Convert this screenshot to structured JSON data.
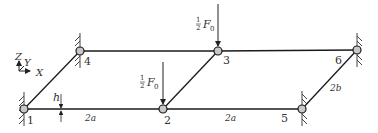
{
  "diagram": {
    "type": "truss-structure",
    "axes": {
      "z": "Z",
      "y": "Y",
      "x": "X"
    },
    "nodes": [
      {
        "id": "1",
        "x": 24,
        "y": 109,
        "support": "wall-left"
      },
      {
        "id": "2",
        "x": 163,
        "y": 109,
        "support": "none"
      },
      {
        "id": "3",
        "x": 218,
        "y": 51,
        "support": "none"
      },
      {
        "id": "4",
        "x": 80,
        "y": 51,
        "support": "wall-left"
      },
      {
        "id": "5",
        "x": 302,
        "y": 109,
        "support": "wall-right"
      },
      {
        "id": "6",
        "x": 357,
        "y": 50,
        "support": "wall-right"
      }
    ],
    "members": [
      [
        "1",
        "2"
      ],
      [
        "2",
        "5"
      ],
      [
        "4",
        "3"
      ],
      [
        "3",
        "6"
      ],
      [
        "1",
        "4"
      ],
      [
        "2",
        "3"
      ],
      [
        "5",
        "6"
      ]
    ],
    "loads": [
      {
        "node": "2",
        "label_frac": "1/2",
        "label_var": "F",
        "label_sub": "0"
      },
      {
        "node": "3",
        "label_frac": "1/2",
        "label_var": "F",
        "label_sub": "0"
      }
    ],
    "dimensions": {
      "h": "h",
      "span_left": "2a",
      "span_right": "2a",
      "diagonal": "2b"
    },
    "colors": {
      "line": "#1a1a1a",
      "node_fill": "#c8c8c8",
      "text": "#333333"
    }
  }
}
